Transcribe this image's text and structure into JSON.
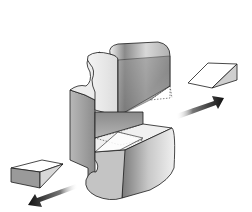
{
  "diagram": {
    "background": "#ffffff",
    "elements": [
      {
        "id": "main-block",
        "kind": "3d-solid",
        "shape": "puzzle-piece C-shape with slot"
      },
      {
        "id": "upper-wedge-ghost",
        "kind": "dashed-outline",
        "location": "upper arm right end"
      },
      {
        "id": "lower-wedge-ghost",
        "kind": "dashed-outline",
        "location": "lower arm inside slot"
      },
      {
        "id": "wedge-right",
        "kind": "wedge",
        "direction": "up-right"
      },
      {
        "id": "wedge-left",
        "kind": "wedge",
        "direction": "down-left"
      },
      {
        "id": "arrow-right",
        "kind": "gradient-arrow",
        "direction": "up-right"
      },
      {
        "id": "arrow-left",
        "kind": "gradient-arrow",
        "direction": "down-left"
      }
    ],
    "colors": {
      "outline": "#1a1a1a",
      "dark_shade": "#6e6e6e",
      "mid_shade": "#a8a8a8",
      "light_shade": "#e6e6e6",
      "arrow": "#111111"
    },
    "caption": "Wedge pieces removed from slotted block"
  }
}
